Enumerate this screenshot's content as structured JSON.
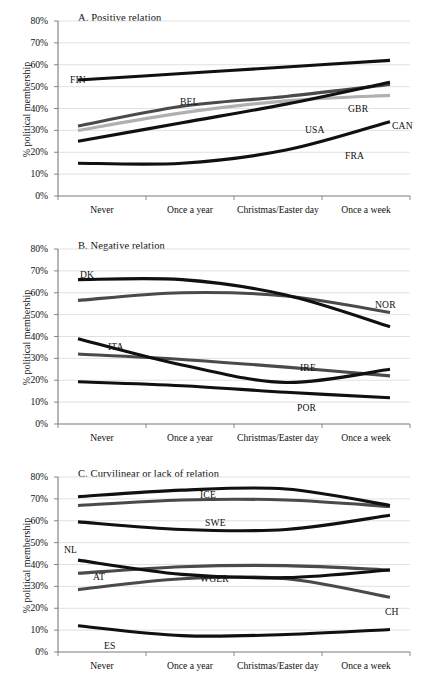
{
  "figure": {
    "y_axis_label": "% political membership",
    "y_ticks": [
      "0%",
      "10%",
      "20%",
      "30%",
      "40%",
      "50%",
      "60%",
      "70%",
      "80%"
    ],
    "x_ticks": [
      "Never",
      "Once a year",
      "Christmas/Easter day",
      "Once a week"
    ],
    "colors": {
      "black": "#101010",
      "dark_gray": "#4a4a4a",
      "light_gray": "#b0b0b0",
      "gridline": "#d9d9d9",
      "axis": "#7a7a7a"
    }
  },
  "chart_data": [
    {
      "type": "line",
      "title": "A. Positive relation",
      "xlabel": "",
      "ylabel": "% political membership",
      "categories": [
        "Never",
        "Once a year",
        "Christmas/Easter day",
        "Once a week"
      ],
      "x": [
        0,
        1,
        2,
        3
      ],
      "ylim": [
        0,
        80
      ],
      "grid": true,
      "legend": "inline-labels",
      "series": [
        {
          "name": "FIN",
          "color": "#101010",
          "label_x": 70,
          "label_y": 74,
          "values": [
            53.0,
            56.0,
            59.0,
            62.0
          ]
        },
        {
          "name": "BEL",
          "color": "#4a4a4a",
          "label_x": 180,
          "label_y": 96,
          "values": [
            32.0,
            41.0,
            45.5,
            51.0
          ]
        },
        {
          "name": "CAN",
          "color": "#b0b0b0",
          "label_x": 392,
          "label_y": 120,
          "values": [
            30.0,
            38.0,
            43.5,
            46.0
          ]
        },
        {
          "name": "USA",
          "color": "#101010",
          "label_x": 305,
          "label_y": 124,
          "values": [
            25.0,
            33.5,
            42.0,
            52.0
          ]
        },
        {
          "name": "GBR",
          "color": "#101010",
          "label_x": 348,
          "label_y": 103,
          "values": [
            25.0,
            33.5,
            42.0,
            52.0
          ]
        },
        {
          "name": "FRA",
          "color": "#101010",
          "label_x": 345,
          "label_y": 150,
          "values": [
            15.0,
            15.0,
            21.0,
            34.0
          ]
        }
      ]
    },
    {
      "type": "line",
      "title": "B. Negative relation",
      "xlabel": "",
      "ylabel": "% political membership",
      "categories": [
        "Never",
        "Once a year",
        "Christmas/Easter day",
        "Once a week"
      ],
      "x": [
        0,
        1,
        2,
        3
      ],
      "ylim": [
        0,
        80
      ],
      "grid": true,
      "legend": "inline-labels",
      "series": [
        {
          "name": "DK",
          "color": "#101010",
          "label_x": 80,
          "label_y": 41,
          "values": [
            66.0,
            66.0,
            59.0,
            44.5
          ]
        },
        {
          "name": "NOR",
          "color": "#4a4a4a",
          "label_x": 375,
          "label_y": 71,
          "values": [
            56.5,
            60.0,
            58.5,
            51.0
          ]
        },
        {
          "name": "ITA",
          "color": "#101010",
          "label_x": 108,
          "label_y": 113,
          "values": [
            39.0,
            27.0,
            19.0,
            25.0
          ]
        },
        {
          "name": "IRE",
          "color": "#4a4a4a",
          "label_x": 300,
          "label_y": 134,
          "values": [
            32.0,
            29.5,
            26.0,
            22.0
          ]
        },
        {
          "name": "POR",
          "color": "#101010",
          "label_x": 297,
          "label_y": 174,
          "values": [
            19.3,
            17.5,
            14.5,
            12.0
          ]
        }
      ]
    },
    {
      "type": "line",
      "title": "C. Curvilinear or lack of relation",
      "xlabel": "",
      "ylabel": "% political membership",
      "categories": [
        "Never",
        "Once a year",
        "Christmas/Easter day",
        "Once a week"
      ],
      "x": [
        0,
        1,
        2,
        3
      ],
      "ylim": [
        0,
        80
      ],
      "grid": true,
      "legend": "inline-labels",
      "series": [
        {
          "name": "ICE",
          "color": "#101010",
          "label_x": 200,
          "label_y": 33,
          "values": [
            71.0,
            74.0,
            74.5,
            67.0
          ]
        },
        {
          "name": "SWE",
          "color": "#4a4a4a",
          "label_x": 205,
          "label_y": 61,
          "values": [
            67.0,
            69.5,
            69.5,
            66.5
          ]
        },
        {
          "name": "NL",
          "color": "#101010",
          "label_x": 64,
          "label_y": 88,
          "values": [
            59.5,
            56.0,
            56.0,
            62.5
          ]
        },
        {
          "name": "AT",
          "color": "#101010",
          "label_x": 93,
          "label_y": 115,
          "values": [
            42.0,
            35.5,
            34.0,
            37.5
          ]
        },
        {
          "name": "WGER",
          "color": "#4a4a4a",
          "label_x": 200,
          "label_y": 117,
          "values": [
            36.0,
            39.0,
            39.5,
            37.5
          ]
        },
        {
          "name": "CH",
          "color": "#4a4a4a",
          "label_x": 385,
          "label_y": 150,
          "values": [
            28.5,
            33.5,
            33.5,
            25.0
          ]
        },
        {
          "name": "ES",
          "color": "#101010",
          "label_x": 104,
          "label_y": 184,
          "values": [
            12.0,
            7.5,
            8.0,
            10.3
          ]
        }
      ]
    }
  ]
}
